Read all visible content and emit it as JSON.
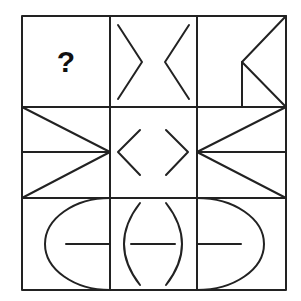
{
  "puzzle": {
    "type": "3x3 figure matrix reasoning puzzle",
    "stroke_color": "#222222",
    "background_color": "#ffffff",
    "missing_cell_label": "?",
    "cells": [
      {
        "row": 0,
        "col": 0,
        "content": "question-mark",
        "label": "?"
      },
      {
        "row": 0,
        "col": 1,
        "content": "two chevrons pointing inward (> <) forming an hourglass gap"
      },
      {
        "row": 0,
        "col": 2,
        "content": "left-pointing wedge from right corners to center-left vertex, with vertical line down from vertex"
      },
      {
        "row": 1,
        "col": 0,
        "content": "right-pointing triangle (corners to right-middle) with horizontal midline"
      },
      {
        "row": 1,
        "col": 1,
        "content": "two chevrons pointing outward (< >)"
      },
      {
        "row": 1,
        "col": 2,
        "content": "left-pointing triangle (corners to left-middle) with horizontal midline"
      },
      {
        "row": 2,
        "col": 0,
        "content": "left half-ellipse arc with horizontal line from center to right edge"
      },
      {
        "row": 2,
        "col": 1,
        "content": "parentheses ( ) with horizontal dash in center"
      },
      {
        "row": 2,
        "col": 2,
        "content": "right half-ellipse arc with horizontal line from left edge to center"
      }
    ]
  }
}
